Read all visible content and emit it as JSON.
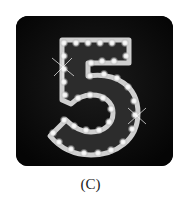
{
  "figure": {
    "caption": "(C)",
    "icon": "marquee-number-five-icon",
    "digit": "5",
    "colors": {
      "background": "#070707",
      "bulb": "#f4f4f4",
      "marquee_outline": "#bdbdbd",
      "marquee_fill": "#3a3a3a"
    }
  }
}
